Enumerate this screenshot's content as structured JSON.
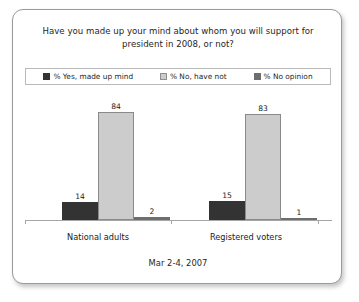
{
  "card": {
    "title": "Have you made up your mind about whom you will support for president in 2008, or not?",
    "footer_date": "Mar 2-4, 2007"
  },
  "legend": {
    "entries": [
      {
        "label": "% Yes, made up mind",
        "color": "#333333"
      },
      {
        "label": "% No, have not",
        "color": "#cccccc"
      },
      {
        "label": "% No opinion",
        "color": "#6e6e6e"
      }
    ]
  },
  "chart_data": {
    "type": "bar",
    "title": "Have you made up your mind about whom you will support for president in 2008, or not?",
    "xlabel": "",
    "ylabel": "",
    "ylim": [
      0,
      100
    ],
    "grid": false,
    "legend_position": "top",
    "categories": [
      "National adults",
      "Registered voters"
    ],
    "series": [
      {
        "name": "% Yes, made up mind",
        "color": "#333333",
        "values": [
          14,
          15
        ]
      },
      {
        "name": "% No, have not",
        "color": "#cccccc",
        "values": [
          84,
          83
        ]
      },
      {
        "name": "% No opinion",
        "color": "#6e6e6e",
        "values": [
          2,
          1
        ]
      }
    ],
    "annotation": "Mar 2-4, 2007"
  }
}
